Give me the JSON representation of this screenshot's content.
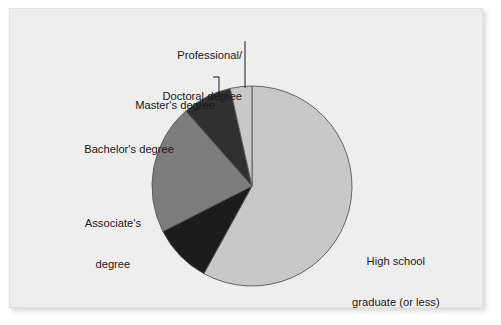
{
  "figure": {
    "name": "education-attainment-pie-chart",
    "background_color": "#ffffff",
    "panel_color": "#eeeeee",
    "panel_border_color": "#e2e2e2"
  },
  "chart_data": {
    "type": "pie",
    "title": "",
    "subtitle": "",
    "xlabel": "",
    "ylabel": "",
    "grid": false,
    "legend_position": "none",
    "label_placement": "outside-with-leader-lines",
    "start_angle_deg": 90,
    "direction": "clockwise",
    "center": {
      "x": 252,
      "y": 186
    },
    "radius": 100,
    "slice_border_color": "#555555",
    "categories": [
      "High school graduate (or less)",
      "Associate's degree",
      "Bachelor's degree",
      "Master's degree",
      "Professional/Doctoral degree"
    ],
    "values": [
      58.0,
      9.5,
      21.0,
      8.0,
      3.5
    ],
    "colors": [
      "#c8c8c8",
      "#1c1c1c",
      "#7d7d7d",
      "#303030",
      "#c8c8c8"
    ],
    "slices": [
      {
        "label": "High school graduate (or less)",
        "label_line1": "High school",
        "label_line2": "graduate (or less)",
        "value": 58.0,
        "color": "#c8c8c8",
        "leader_line": false
      },
      {
        "label": "Associate's degree",
        "label_line1": "Associate's",
        "label_line2": "degree",
        "value": 9.5,
        "color": "#1c1c1c",
        "leader_line": false
      },
      {
        "label": "Bachelor's degree",
        "label_line1": "Bachelor's degree",
        "label_line2": "",
        "value": 21.0,
        "color": "#7d7d7d",
        "leader_line": false
      },
      {
        "label": "Master's degree",
        "label_line1": "Master's degree",
        "label_line2": "",
        "value": 8.0,
        "color": "#303030",
        "leader_line": true
      },
      {
        "label": "Professional/Doctoral degree",
        "label_line1": "Professional/",
        "label_line2": "Doctoral degree",
        "value": 3.5,
        "color": "#c8c8c8",
        "leader_line": true
      }
    ]
  },
  "labels": {
    "professional_line1": "Professional/",
    "professional_line2": "Doctoral degree",
    "masters": "Master's degree",
    "bachelors": "Bachelor's degree",
    "associates_line1": "Associate's",
    "associates_line2": "degree",
    "highschool_line1": "High school",
    "highschool_line2": "graduate (or less)"
  }
}
